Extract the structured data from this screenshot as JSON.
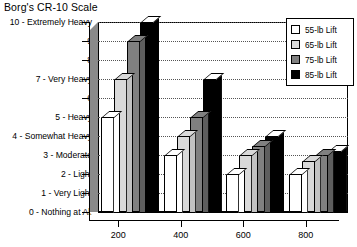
{
  "chart_data": {
    "type": "bar",
    "title": "Borg's CR-10 Scale",
    "xlabel": "",
    "ylabel": "",
    "categories": [
      "200",
      "400",
      "600",
      "800"
    ],
    "series": [
      {
        "name": "55-lb Lift",
        "color": "#ffffff",
        "values": [
          5,
          3,
          2,
          2
        ]
      },
      {
        "name": "65-lb Lift",
        "color": "#d9d9d9",
        "values": [
          7,
          4,
          3,
          2.7
        ]
      },
      {
        "name": "75-lb Lift",
        "color": "#808080",
        "values": [
          9,
          5,
          3.5,
          3
        ]
      },
      {
        "name": "85-lb Lift",
        "color": "#000000",
        "values": [
          10,
          7,
          4,
          3.2
        ]
      }
    ],
    "ylim": [
      0,
      10
    ],
    "ytick_values": [
      0,
      1,
      2,
      3,
      4,
      5,
      6,
      7,
      8,
      9,
      10
    ],
    "ytick_labels": [
      "0 - Nothing at All",
      "1 - Very Light",
      "2 - Light",
      "3 - Moderate",
      "4 - Somewhat Heavy",
      "5 - Heavy",
      "6",
      "7 - Very Heavy",
      "8",
      "9",
      "10 - Extremely Heavy"
    ],
    "grid": true,
    "legend_position": "top-right"
  }
}
